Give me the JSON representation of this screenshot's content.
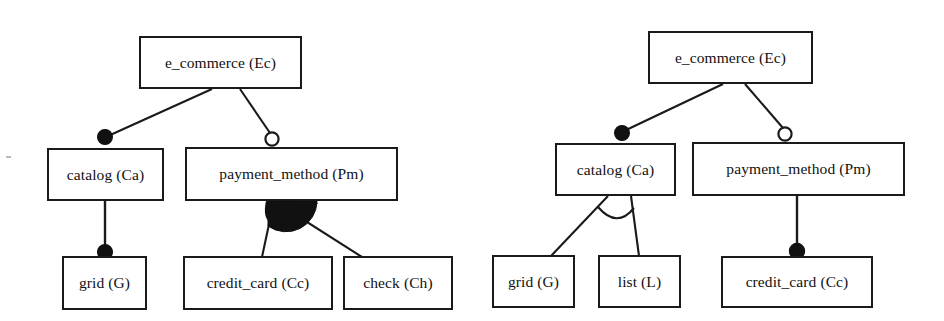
{
  "figure": {
    "kind": "feature-model-diagrams",
    "background_color": "#ffffff",
    "line_color": "#1a1a1a",
    "box_fill": "#ffffff",
    "diagram_count": 2
  },
  "diagrams": [
    {
      "id": "left-feature-model",
      "name": "left-diagram",
      "nodes": [
        {
          "id": "ec",
          "label": "e_commerce (Ec)",
          "x": 139,
          "y": 36,
          "w": 163,
          "h": 53
        },
        {
          "id": "ca",
          "label": "catalog (Ca)",
          "x": 47,
          "y": 148,
          "w": 117,
          "h": 53
        },
        {
          "id": "pm",
          "label": "payment_method (Pm)",
          "x": 185,
          "y": 147,
          "w": 213,
          "h": 54
        },
        {
          "id": "g",
          "label": "grid (G)",
          "x": 62,
          "y": 256,
          "w": 85,
          "h": 54
        },
        {
          "id": "cc",
          "label": "credit_card (Cc)",
          "x": 183,
          "y": 256,
          "w": 150,
          "h": 54
        },
        {
          "id": "ch",
          "label": "check (Ch)",
          "x": 343,
          "y": 256,
          "w": 110,
          "h": 54
        }
      ],
      "edges": [
        {
          "from": "ec",
          "to": "ca",
          "type": "mandatory",
          "marker": "filled-circle"
        },
        {
          "from": "ec",
          "to": "pm",
          "type": "optional",
          "marker": "hollow-circle"
        },
        {
          "from": "ca",
          "to": "g",
          "type": "mandatory",
          "marker": "filled-circle"
        },
        {
          "from": "pm",
          "to": "cc",
          "type": "or-group",
          "marker": "filled-arc"
        },
        {
          "from": "pm",
          "to": "ch",
          "type": "or-group",
          "marker": "filled-arc"
        }
      ],
      "groups": [
        {
          "parent": "pm",
          "children": [
            "cc",
            "ch"
          ],
          "type": "or",
          "arc_fill": "filled"
        }
      ]
    },
    {
      "id": "right-feature-model",
      "name": "right-diagram",
      "nodes": [
        {
          "id": "ec",
          "label": "e_commerce (Ec)",
          "x": 648,
          "y": 31,
          "w": 165,
          "h": 53
        },
        {
          "id": "ca",
          "label": "catalog (Ca)",
          "x": 555,
          "y": 143,
          "w": 121,
          "h": 53
        },
        {
          "id": "pm",
          "label": "payment_method (Pm)",
          "x": 692,
          "y": 142,
          "w": 213,
          "h": 54
        },
        {
          "id": "g",
          "label": "grid (G)",
          "x": 492,
          "y": 255,
          "w": 83,
          "h": 53
        },
        {
          "id": "l",
          "label": "list (L)",
          "x": 598,
          "y": 255,
          "w": 83,
          "h": 53
        },
        {
          "id": "cc",
          "label": "credit_card (Cc)",
          "x": 721,
          "y": 256,
          "w": 152,
          "h": 52
        }
      ],
      "edges": [
        {
          "from": "ec",
          "to": "ca",
          "type": "mandatory",
          "marker": "filled-circle"
        },
        {
          "from": "ec",
          "to": "pm",
          "type": "optional",
          "marker": "hollow-circle"
        },
        {
          "from": "ca",
          "to": "g",
          "type": "xor-group",
          "marker": "hollow-arc"
        },
        {
          "from": "ca",
          "to": "l",
          "type": "xor-group",
          "marker": "hollow-arc"
        },
        {
          "from": "pm",
          "to": "cc",
          "type": "mandatory",
          "marker": "filled-circle"
        }
      ],
      "groups": [
        {
          "parent": "ca",
          "children": [
            "g",
            "l"
          ],
          "type": "xor",
          "arc_fill": "hollow"
        }
      ]
    }
  ],
  "legend_semantics": {
    "filled_circle": "mandatory feature",
    "hollow_circle": "optional feature",
    "filled_arc": "or-group (one or more)",
    "hollow_arc": "alternative / xor-group (exactly one)"
  }
}
